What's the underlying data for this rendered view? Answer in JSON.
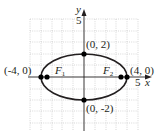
{
  "diagram": {
    "type": "ellipse-graph",
    "equation_implied": "x^2/16 + y^2/4 = 1",
    "axes": {
      "x_label": "x",
      "y_label": "y",
      "x_tick_label": "5",
      "y_tick_label": "5",
      "grid": true,
      "x_range": [
        -5,
        5
      ],
      "y_range": [
        -5,
        5
      ]
    },
    "vertices": [
      {
        "label": "(-4, 0)",
        "x": -4,
        "y": 0
      },
      {
        "label": "(4, 0)",
        "x": 4,
        "y": 0
      }
    ],
    "co_vertices": [
      {
        "label": "(0, 2)",
        "x": 0,
        "y": 2
      },
      {
        "label": "(0, -2)",
        "x": 0,
        "y": -2
      }
    ],
    "foci": [
      {
        "name": "F",
        "sub": "1",
        "x": -3.46,
        "y": 0
      },
      {
        "name": "F",
        "sub": "2",
        "x": 3.46,
        "y": 0
      }
    ],
    "colors": {
      "curve": "#231f20",
      "axis": "#231f20",
      "grid": "#b9b9b9",
      "point": "#000000"
    }
  }
}
